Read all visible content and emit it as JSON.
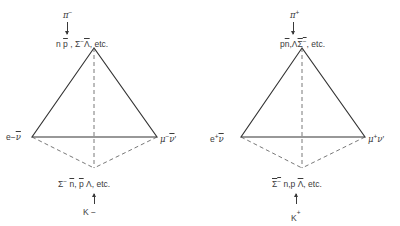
{
  "diagram": {
    "type": "weak-interaction-tetrahedra",
    "left": {
      "top_particle": "π⁻",
      "top_products": "n p̄ , Σ⁻ Λ̄, etc.",
      "top_products_parts": {
        "n": "n",
        "pbar": "p",
        "sep1": " , ",
        "sigma": "Σ",
        "sigma_sup": "−",
        "lambdabar": "Λ",
        "etc": ", etc."
      },
      "left_vertex": "e⁻ν̄",
      "left_vertex_parts": {
        "e": "e",
        "sup": "−",
        "nu": "ν"
      },
      "right_vertex": "μ⁻ν̄′",
      "right_vertex_parts": {
        "mu": "μ",
        "sup": "−",
        "nu": "ν",
        "prime": "′"
      },
      "bottom_products": "Σ⁻ n̄, p̄ Λ, etc.",
      "bottom_products_parts": {
        "sigma": "Σ",
        "sigma_sup": "−",
        "nbar": "n",
        "sep1": ",",
        "pbar": "p",
        "lambda": "Λ",
        "etc": ", etc."
      },
      "bottom_particle": "K⁻",
      "bottom_particle_parts": {
        "k": "K",
        "sup": "−"
      }
    },
    "right": {
      "top_particle": "π⁺",
      "top_products": "p n̄, Λ Σ̄⁻, etc.",
      "top_products_parts": {
        "p": "p",
        "nbar": "n",
        "sep1": ",",
        "lambda": "Λ",
        "sigmabar": "Σ",
        "sigma_sup": "−",
        "etc": ", etc."
      },
      "left_vertex": "e⁺ν",
      "left_vertex_parts": {
        "e": "e",
        "sup": "+",
        "nu": "ν"
      },
      "right_vertex": "μ⁺ν′",
      "right_vertex_parts": {
        "mu": "μ",
        "sup": "+",
        "nu": "ν",
        "prime": "′"
      },
      "bottom_products": "Σ̄⁻ n, p Λ̄, etc.",
      "bottom_products_parts": {
        "sigmabar": "Σ",
        "sigma_sup": "−",
        "n": "n",
        "sep1": ",",
        "p": "p",
        "lambdabar": "Λ",
        "etc": ", etc."
      },
      "bottom_particle": "K⁺",
      "bottom_particle_parts": {
        "k": "K",
        "sup": "+"
      }
    },
    "colors": {
      "line": "#333333",
      "dashed": "#555555",
      "text": "#3a3a3a",
      "background": "#ffffff"
    }
  }
}
